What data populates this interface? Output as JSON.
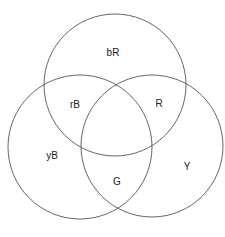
{
  "diagram": {
    "type": "venn",
    "stroke_color": "#555555",
    "circles": [
      {
        "name": "top",
        "cx": 115,
        "cy": 85,
        "r": 71
      },
      {
        "name": "left",
        "cx": 80,
        "cy": 147,
        "r": 72
      },
      {
        "name": "right",
        "cx": 152,
        "cy": 146,
        "r": 71
      }
    ],
    "regions": {
      "top_only": "bR",
      "top_left": "rB",
      "top_right": "R",
      "left_only": "yB",
      "left_right": "G",
      "right_only": "Y"
    }
  }
}
